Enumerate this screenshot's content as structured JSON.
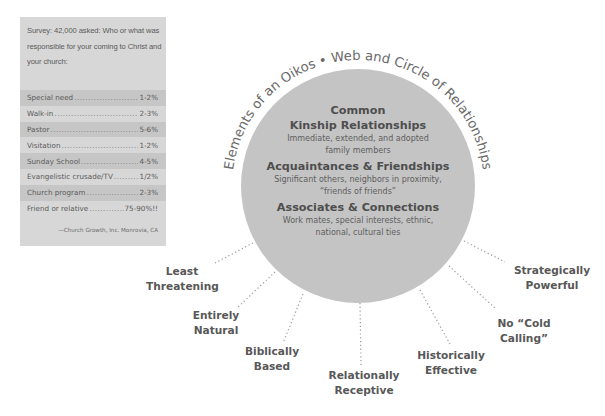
{
  "survey": {
    "question": "Survey: 42,000 asked: Who or what was responsible for your coming to Christ and your church:",
    "rows": [
      {
        "label": "Special need",
        "value": "1-2%"
      },
      {
        "label": "Walk-in",
        "value": "2-3%"
      },
      {
        "label": "Pastor",
        "value": "5-6%"
      },
      {
        "label": "Visitation",
        "value": "1-2%"
      },
      {
        "label": "Sunday School",
        "value": "4-5%"
      },
      {
        "label": "Evangelistic crusade/TV",
        "value": "1/2%"
      },
      {
        "label": "Church program",
        "value": "2-3%"
      },
      {
        "label": "Friend or relative",
        "value": "75-90%!!"
      }
    ],
    "source": "—Church Growth, Inc.  Monrovia, CA"
  },
  "diagram": {
    "arc_title": "Elements of an Oikos • Web and Circle of Relationships",
    "circle": {
      "heading_pre": "Common",
      "sections": [
        {
          "title": "Kinship Relationships",
          "desc_line1": "Immediate, extended, and adopted",
          "desc_line2": "family members"
        },
        {
          "title": "Acquaintances & Friendships",
          "desc_line1": "Significant others, neighbors in proximity,",
          "desc_line2": "“friends of friends”"
        },
        {
          "title": "Associates & Connections",
          "desc_line1": "Work mates, special interests, ethnic,",
          "desc_line2": "national, cultural ties"
        }
      ]
    },
    "outer_labels": [
      {
        "line1": "Least",
        "line2": "Threatening"
      },
      {
        "line1": "Entirely",
        "line2": "Natural"
      },
      {
        "line1": "Biblically",
        "line2": "Based"
      },
      {
        "line1": "Relationally",
        "line2": "Receptive"
      },
      {
        "line1": "Historically",
        "line2": "Effective"
      },
      {
        "line1": "No “Cold",
        "line2": "Calling”"
      },
      {
        "line1": "Strategically",
        "line2": "Powerful"
      }
    ],
    "colors": {
      "circle_fill": "#c4c4c4",
      "survey_bg": "#d7d7d7",
      "survey_band": "#c6c6c6",
      "label_text": "#585858",
      "dotted_line": "#9a9a9a"
    }
  }
}
